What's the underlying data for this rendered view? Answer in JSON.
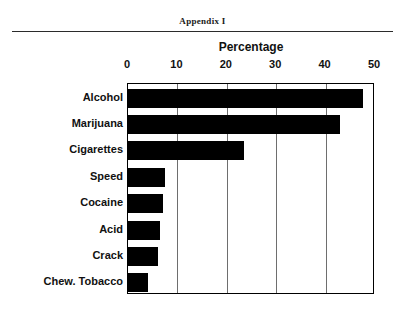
{
  "header": {
    "appendix_label": "Appendix I"
  },
  "chart_data": {
    "type": "bar",
    "orientation": "horizontal",
    "title": "Percentage",
    "xlabel": "Percentage",
    "ylabel": "",
    "xlim": [
      0,
      50
    ],
    "xticks": [
      0,
      10,
      20,
      30,
      40,
      50
    ],
    "xtick_labels": [
      "0",
      "10",
      "20",
      "30",
      "40",
      "50"
    ],
    "grid": true,
    "grid_axis": "x",
    "legend": false,
    "bar_color": "#000000",
    "categories": [
      "Alcohol",
      "Marijuana",
      "Cigarettes",
      "Speed",
      "Cocaine",
      "Acid",
      "Crack",
      "Chew. Tobacco"
    ],
    "values": [
      47.5,
      43,
      23.5,
      7.5,
      7,
      6.5,
      6,
      4
    ]
  }
}
